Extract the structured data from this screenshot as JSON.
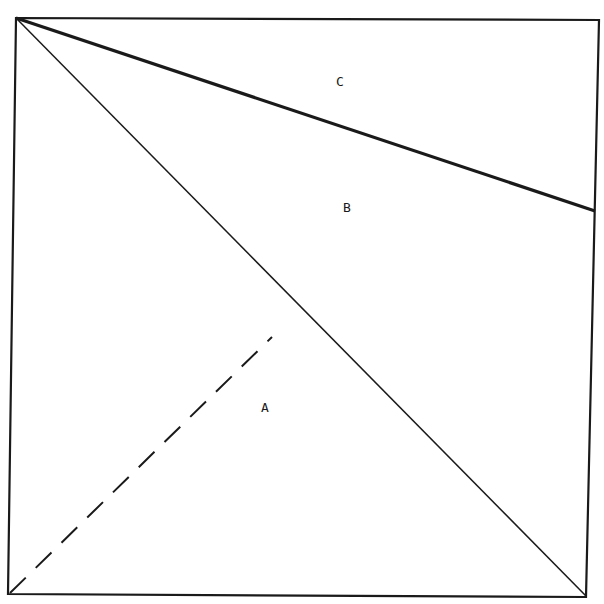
{
  "diagram": {
    "type": "geometric-partition",
    "regions": [
      {
        "id": "C",
        "label": "C"
      },
      {
        "id": "B",
        "label": "B"
      },
      {
        "id": "A",
        "label": "A"
      }
    ],
    "colors": {
      "line": "#1a1a1a",
      "background": "#ffffff"
    }
  }
}
